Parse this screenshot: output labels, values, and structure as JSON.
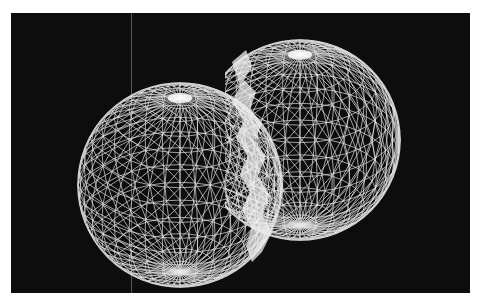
{
  "image": {
    "description": "Two overlapping white wireframe geodesic spheres on a black background, with a bright white jagged membrane along their intersection",
    "background_color": "#0d0d0d",
    "page_color": "#ffffff",
    "wire_color": "#e8e8e8",
    "membrane_color": "#f0f0f0",
    "objects": [
      {
        "name": "left-sphere",
        "cx": 180,
        "cy": 200,
        "r": 102
      },
      {
        "name": "right-sphere",
        "cx": 300,
        "cy": 150,
        "r": 100
      }
    ]
  }
}
